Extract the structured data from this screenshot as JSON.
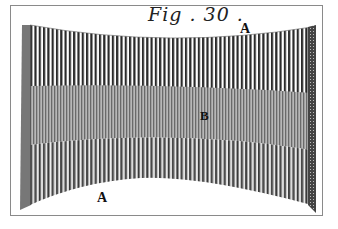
{
  "figure": {
    "title": "Fig . 30 .",
    "labels": [
      {
        "id": "A-top",
        "text": "A"
      },
      {
        "id": "B-middle",
        "text": "B"
      },
      {
        "id": "A-bottom",
        "text": "A"
      }
    ],
    "colors": {
      "ink": "#1a1a1a",
      "paper": "#ffffff",
      "frame": "#8a8a8a",
      "shade": "#9a9a9a"
    }
  }
}
